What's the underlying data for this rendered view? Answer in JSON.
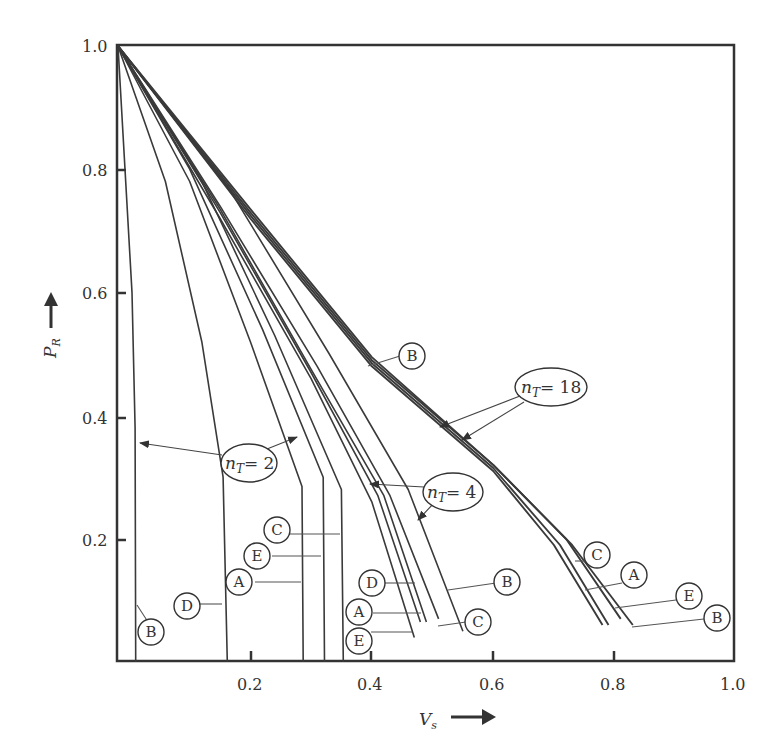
{
  "chart_data": {
    "type": "line",
    "title": "",
    "xlabel": "V_s",
    "ylabel": "P_R",
    "xlim": [
      0,
      1.0
    ],
    "ylim": [
      0,
      1.0
    ],
    "x_ticks": [
      "0.2",
      "0.4",
      "0.6",
      "0.8",
      "1.0"
    ],
    "y_ticks": [
      "0.2",
      "0.4",
      "0.6",
      "0.8",
      "1.0"
    ],
    "grid": false,
    "legend": "inline circled labels A-E with n_T group annotations",
    "groups": [
      {
        "name": "n_T = 2",
        "series": [
          {
            "name": "B",
            "points": [
              [
                0,
                1.0
              ],
              [
                0.005,
                0.6
              ],
              [
                0.01,
                0.38
              ],
              [
                0.011,
                0.0
              ]
            ]
          },
          {
            "name": "D",
            "points": [
              [
                0,
                1.0
              ],
              [
                0.06,
                0.78
              ],
              [
                0.12,
                0.52
              ],
              [
                0.155,
                0.3
              ],
              [
                0.162,
                0.0
              ]
            ]
          },
          {
            "name": "A",
            "points": [
              [
                0,
                1.0
              ],
              [
                0.1,
                0.78
              ],
              [
                0.2,
                0.52
              ],
              [
                0.285,
                0.285
              ],
              [
                0.287,
                0.0
              ]
            ]
          },
          {
            "name": "E",
            "points": [
              [
                0,
                1.0
              ],
              [
                0.1,
                0.8
              ],
              [
                0.22,
                0.54
              ],
              [
                0.32,
                0.3
              ],
              [
                0.322,
                0.0
              ]
            ]
          },
          {
            "name": "C",
            "points": [
              [
                0,
                1.0
              ],
              [
                0.12,
                0.78
              ],
              [
                0.24,
                0.53
              ],
              [
                0.35,
                0.28
              ],
              [
                0.353,
                0.0
              ]
            ]
          }
        ]
      },
      {
        "name": "n_T = 4",
        "series": [
          {
            "name": "E",
            "points": [
              [
                0,
                1.0
              ],
              [
                0.15,
                0.72
              ],
              [
                0.3,
                0.46
              ],
              [
                0.4,
                0.26
              ],
              [
                0.47,
                0.04
              ]
            ]
          },
          {
            "name": "A",
            "points": [
              [
                0,
                1.0
              ],
              [
                0.15,
                0.73
              ],
              [
                0.3,
                0.47
              ],
              [
                0.41,
                0.27
              ],
              [
                0.48,
                0.065
              ]
            ]
          },
          {
            "name": "D",
            "points": [
              [
                0,
                1.0
              ],
              [
                0.15,
                0.735
              ],
              [
                0.3,
                0.475
              ],
              [
                0.42,
                0.27
              ],
              [
                0.49,
                0.065
              ]
            ]
          },
          {
            "name": "C",
            "points": [
              [
                0,
                1.0
              ],
              [
                0.15,
                0.74
              ],
              [
                0.31,
                0.48
              ],
              [
                0.43,
                0.27
              ],
              [
                0.51,
                0.07
              ]
            ]
          },
          {
            "name": "B",
            "points": [
              [
                0,
                1.0
              ],
              [
                0.17,
                0.76
              ],
              [
                0.33,
                0.5
              ],
              [
                0.46,
                0.28
              ],
              [
                0.55,
                0.05
              ]
            ]
          }
        ]
      },
      {
        "name": "n_T = 18",
        "series": [
          {
            "name": "C",
            "points": [
              [
                0,
                1.0
              ],
              [
                0.2,
                0.72
              ],
              [
                0.4,
                0.48
              ],
              [
                0.6,
                0.31
              ],
              [
                0.7,
                0.19
              ],
              [
                0.78,
                0.06
              ]
            ]
          },
          {
            "name": "A",
            "points": [
              [
                0,
                1.0
              ],
              [
                0.2,
                0.725
              ],
              [
                0.4,
                0.485
              ],
              [
                0.6,
                0.315
              ],
              [
                0.71,
                0.19
              ],
              [
                0.79,
                0.06
              ]
            ]
          },
          {
            "name": "E",
            "points": [
              [
                0,
                1.0
              ],
              [
                0.2,
                0.73
              ],
              [
                0.4,
                0.49
              ],
              [
                0.6,
                0.32
              ],
              [
                0.72,
                0.2
              ],
              [
                0.81,
                0.07
              ]
            ]
          },
          {
            "name": "B",
            "points": [
              [
                0,
                1.0
              ],
              [
                0.2,
                0.735
              ],
              [
                0.4,
                0.495
              ],
              [
                0.6,
                0.32
              ],
              [
                0.73,
                0.19
              ],
              [
                0.83,
                0.06
              ]
            ]
          }
        ]
      }
    ],
    "annotations": [
      {
        "text": "n_T = 2",
        "targets": "leftmost B and C curves of first group"
      },
      {
        "text": "n_T = 4",
        "targets": "n_T=4 curve bundle"
      },
      {
        "text": "n_T = 18",
        "targets": "n_T=18 curve bundle"
      }
    ]
  },
  "axes": {
    "x_title_main": "V",
    "x_title_sub": "s",
    "y_title_main": "P",
    "y_title_sub": "R",
    "x_tick_labels": [
      "0.2",
      "0.4",
      "0.6",
      "0.8",
      "1.0"
    ],
    "y_tick_labels": [
      "1.0",
      "0.8",
      "0.6",
      "0.4",
      "0.2"
    ]
  },
  "annotations": {
    "nt2": {
      "main": "n",
      "sub": "T",
      "eq": "= 2"
    },
    "nt4": {
      "main": "n",
      "sub": "T",
      "eq": "= 4"
    },
    "nt18": {
      "main": "n",
      "sub": "T",
      "eq": "= 18"
    }
  },
  "labels": {
    "g2_B": "B",
    "g2_D": "D",
    "g2_A": "A",
    "g2_E": "E",
    "g2_C": "C",
    "g4_D": "D",
    "g4_A": "A",
    "g4_E": "E",
    "g4_B": "B",
    "g4_C": "C",
    "g18_B_top": "B",
    "g18_C": "C",
    "g18_A": "A",
    "g18_E": "E",
    "g18_B": "B"
  },
  "colors": {
    "line": "#3a3a3a",
    "background": "#ffffff"
  }
}
